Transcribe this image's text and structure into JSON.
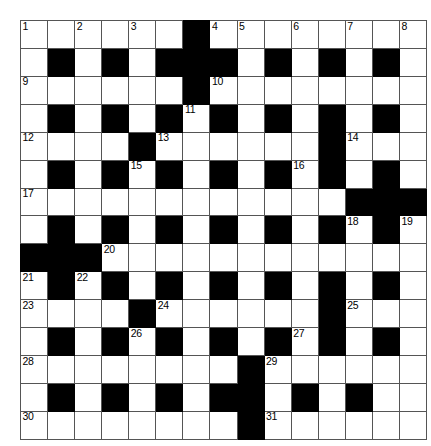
{
  "puzzle": {
    "type": "crossword-grid",
    "rows": 15,
    "cols": 15,
    "cell_size_px": 26,
    "colors": {
      "block": "#000000",
      "cell": "#ffffff",
      "grid_line": "#555555",
      "border": "#1a1a1a",
      "number_text": "#000000"
    },
    "legend": {
      "0": "white (fillable cell)",
      "1": "black (blocked cell)"
    },
    "grid": [
      [
        0,
        0,
        0,
        0,
        0,
        0,
        1,
        0,
        0,
        0,
        0,
        0,
        0,
        0,
        0
      ],
      [
        0,
        1,
        0,
        1,
        0,
        1,
        1,
        1,
        0,
        1,
        0,
        1,
        0,
        1,
        0
      ],
      [
        0,
        0,
        0,
        0,
        0,
        0,
        1,
        0,
        0,
        0,
        0,
        0,
        0,
        0,
        0
      ],
      [
        0,
        1,
        0,
        1,
        0,
        1,
        0,
        1,
        0,
        1,
        0,
        1,
        0,
        1,
        0
      ],
      [
        0,
        0,
        0,
        0,
        1,
        0,
        0,
        0,
        0,
        0,
        0,
        1,
        0,
        0,
        0
      ],
      [
        0,
        1,
        0,
        1,
        0,
        1,
        0,
        1,
        0,
        1,
        0,
        1,
        0,
        1,
        0
      ],
      [
        0,
        0,
        0,
        0,
        0,
        0,
        0,
        0,
        0,
        0,
        0,
        0,
        1,
        1,
        1
      ],
      [
        0,
        1,
        0,
        1,
        0,
        1,
        0,
        1,
        0,
        1,
        0,
        1,
        0,
        1,
        0
      ],
      [
        1,
        1,
        1,
        0,
        0,
        0,
        0,
        0,
        0,
        0,
        0,
        0,
        0,
        0,
        0
      ],
      [
        0,
        1,
        0,
        1,
        0,
        1,
        0,
        1,
        0,
        1,
        0,
        1,
        0,
        1,
        0
      ],
      [
        0,
        0,
        0,
        0,
        1,
        0,
        0,
        0,
        0,
        0,
        0,
        1,
        0,
        0,
        0
      ],
      [
        0,
        1,
        0,
        1,
        0,
        1,
        0,
        1,
        0,
        1,
        0,
        1,
        0,
        1,
        0
      ],
      [
        0,
        0,
        0,
        0,
        0,
        0,
        0,
        0,
        1,
        0,
        0,
        0,
        0,
        0,
        0
      ],
      [
        0,
        1,
        0,
        1,
        0,
        1,
        0,
        1,
        1,
        0,
        1,
        0,
        1,
        0,
        0
      ],
      [
        0,
        0,
        0,
        0,
        0,
        0,
        0,
        0,
        1,
        0,
        0,
        0,
        0,
        0,
        0
      ]
    ],
    "numbers": [
      {
        "n": "1",
        "row": 0,
        "col": 0
      },
      {
        "n": "2",
        "row": 0,
        "col": 2
      },
      {
        "n": "3",
        "row": 0,
        "col": 4
      },
      {
        "n": "4",
        "row": 0,
        "col": 7
      },
      {
        "n": "5",
        "row": 0,
        "col": 8
      },
      {
        "n": "6",
        "row": 0,
        "col": 10
      },
      {
        "n": "7",
        "row": 0,
        "col": 12
      },
      {
        "n": "8",
        "row": 0,
        "col": 14
      },
      {
        "n": "9",
        "row": 2,
        "col": 0
      },
      {
        "n": "10",
        "row": 2,
        "col": 7
      },
      {
        "n": "11",
        "row": 3,
        "col": 6
      },
      {
        "n": "12",
        "row": 4,
        "col": 0
      },
      {
        "n": "13",
        "row": 4,
        "col": 5
      },
      {
        "n": "14",
        "row": 4,
        "col": 12
      },
      {
        "n": "15",
        "row": 5,
        "col": 4
      },
      {
        "n": "16",
        "row": 5,
        "col": 10
      },
      {
        "n": "17",
        "row": 6,
        "col": 0
      },
      {
        "n": "18",
        "row": 7,
        "col": 12
      },
      {
        "n": "19",
        "row": 7,
        "col": 14
      },
      {
        "n": "20",
        "row": 8,
        "col": 3
      },
      {
        "n": "21",
        "row": 9,
        "col": 0
      },
      {
        "n": "22",
        "row": 9,
        "col": 2
      },
      {
        "n": "23",
        "row": 10,
        "col": 0
      },
      {
        "n": "24",
        "row": 10,
        "col": 5
      },
      {
        "n": "25",
        "row": 10,
        "col": 12
      },
      {
        "n": "26",
        "row": 11,
        "col": 4
      },
      {
        "n": "27",
        "row": 11,
        "col": 10
      },
      {
        "n": "28",
        "row": 12,
        "col": 0
      },
      {
        "n": "29",
        "row": 12,
        "col": 9
      },
      {
        "n": "30",
        "row": 14,
        "col": 0
      },
      {
        "n": "31",
        "row": 14,
        "col": 9
      }
    ]
  }
}
